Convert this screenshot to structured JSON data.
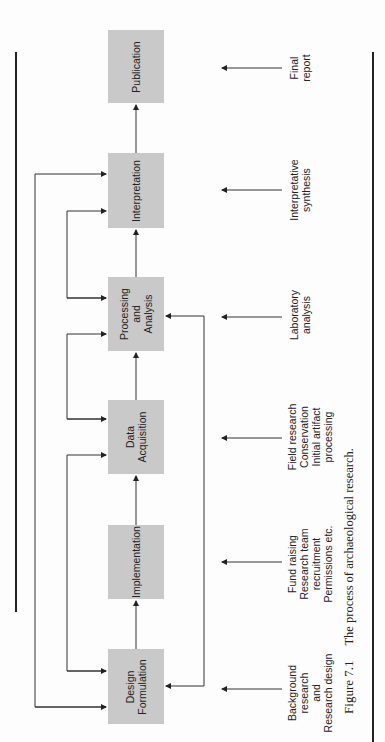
{
  "figure": {
    "caption_number": "Figure 7.1",
    "caption_text": "The process of archaeological research.",
    "orientation": "rotated 90° counter-clockwise"
  },
  "stages": [
    {
      "id": "design",
      "lines": [
        "Design",
        "Formulation"
      ],
      "activity": [
        "Background",
        "research",
        "and",
        "Research design"
      ]
    },
    {
      "id": "implementation",
      "lines": [
        "Implementation"
      ],
      "activity": [
        "Fund raising",
        "Research team",
        "recruitment",
        "Permissions  etc."
      ]
    },
    {
      "id": "acquisition",
      "lines": [
        "Data",
        "Acquisition"
      ],
      "activity": [
        "Field research",
        "Conservation",
        "Initial artifact",
        "processing"
      ]
    },
    {
      "id": "processing",
      "lines": [
        "Processing",
        "and",
        "Analysis"
      ],
      "activity": [
        "Laboratory",
        "analysis"
      ]
    },
    {
      "id": "interpretation",
      "lines": [
        "Interpretation"
      ],
      "activity": [
        "Interpretative",
        "synthesis"
      ]
    },
    {
      "id": "publication",
      "lines": [
        "Publication"
      ],
      "activity": [
        "Final",
        "report"
      ]
    }
  ],
  "colors": {
    "box_fill": "#c9c9c9",
    "line": "#333333",
    "text": "#222222"
  }
}
